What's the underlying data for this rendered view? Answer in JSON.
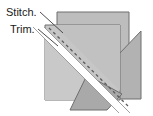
{
  "diagram": {
    "type": "sewing-instruction-illustration",
    "canvas": {
      "width": 153,
      "height": 116,
      "background": "#ffffff"
    },
    "labels": [
      {
        "id": "stitch",
        "text": "Stitch.",
        "x": 6,
        "y": 16,
        "leader": {
          "from_x": 40,
          "from_y": 12,
          "to_x": 62,
          "to_y": 32
        }
      },
      {
        "id": "trim",
        "text": "Trim.",
        "x": 10,
        "y": 33,
        "leader": {
          "from_x": 39,
          "from_y": 29,
          "to_x": 57,
          "to_y": 44
        }
      }
    ],
    "colors": {
      "fabric_back": "#b9b9b9",
      "fabric_front": "#c4c4c4",
      "fabric_light": "#cfcfcf",
      "flap": "#b3b3b3",
      "bottom_triangle": "#a8a8a8",
      "outline": "#6e6e6e",
      "trim_line": "#ffffff",
      "stitch_line": "#5a5a5a",
      "leader_line": "#4d4d4d",
      "label_text": "#1a1a1a"
    },
    "shapes": {
      "back_square": {
        "name": "back-fabric-square",
        "points": "57,12 129,12 129,92 57,92",
        "fill": "#bdbdbd"
      },
      "front_square": {
        "name": "front-fabric-square",
        "points": "45,25 120,25 120,100 45,100",
        "fill": "#c6c6c6"
      },
      "right_flap": {
        "name": "right-fabric-flap",
        "points": "119,53 141,30 141,99 119,99",
        "fill": "#b2b2b2"
      },
      "bottom_triangle": {
        "name": "bottom-fabric-triangle",
        "points": "71,110 105,110 121,92 88,76",
        "fill": "#a9a9a9"
      },
      "trim_band": {
        "name": "trim-cut-line",
        "points": "34,28 45,28 128,112 117,112",
        "fill": "#ffffff"
      },
      "lower_left_wedge": {
        "name": "lower-left-fabric-wedge",
        "points": "45,38 45,100 108,100",
        "fill": "#c9c9c9"
      },
      "upper_right_wedge": {
        "name": "upper-right-fabric-wedge",
        "points": "52,25 120,25 120,97",
        "fill": "#c2c2c2"
      }
    },
    "stitch_line": {
      "name": "stitch-dashed-line",
      "x1": 48,
      "y1": 28,
      "x2": 127,
      "y2": 105,
      "dash": "3 3",
      "width": 1.2
    },
    "trim_line": {
      "name": "trim-white-line",
      "x1": 39,
      "y1": 29,
      "x2": 122,
      "y2": 112,
      "width": 4
    }
  }
}
